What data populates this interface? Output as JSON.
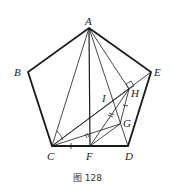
{
  "caption": "图 128",
  "points": {
    "A": {
      "label": "A",
      "x": 89,
      "y": 28
    },
    "B": {
      "label": "B",
      "x": 28,
      "y": 72
    },
    "C": {
      "label": "C",
      "x": 52,
      "y": 146
    },
    "D": {
      "label": "D",
      "x": 128,
      "y": 146
    },
    "E": {
      "label": "E",
      "x": 151,
      "y": 72
    },
    "F": {
      "label": "F",
      "x": 90,
      "y": 146
    },
    "G": {
      "label": "G",
      "x": 120,
      "y": 124
    },
    "H": {
      "label": "H",
      "x": 129,
      "y": 89
    },
    "I": {
      "label": "I"
    }
  },
  "colors": {
    "stroke": "#1a1a1a",
    "text": "#222222"
  }
}
